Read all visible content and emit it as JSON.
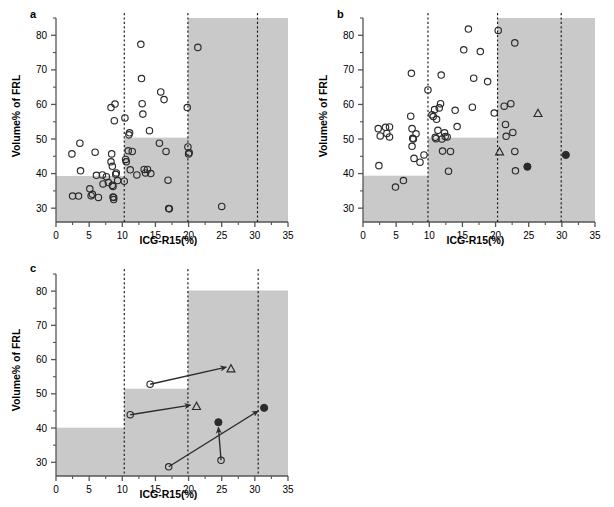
{
  "figure": {
    "axis_label_x": "ICG-R15(%)",
    "axis_label_y": "Volume% of FRL",
    "panel_a_letter": "a",
    "panel_b_letter": "b",
    "panel_c_letter": "c",
    "colors": {
      "shade": "#c9c9c9",
      "axis": "#555555",
      "marker": "#2b2b2b",
      "dashed": "#1a1a1a"
    },
    "xticks": [
      "0",
      "5",
      "10",
      "15",
      "20",
      "25",
      "30",
      "35"
    ],
    "yticks": [
      "30",
      "40",
      "50",
      "60",
      "70",
      "80"
    ]
  },
  "chart_data": [
    {
      "type": "scatter",
      "panel": "a",
      "title": "a",
      "xlabel": "ICG-R15(%)",
      "ylabel": "Volume% of FRL",
      "xlim": [
        0,
        35
      ],
      "ylim": [
        26,
        85
      ],
      "xticks": [
        0,
        5,
        10,
        15,
        20,
        25,
        30,
        35
      ],
      "yticks": [
        30,
        40,
        50,
        60,
        70,
        80
      ],
      "grid": false,
      "legend": "none",
      "vertical_dashed_lines": [
        10.3,
        19.9,
        30.4
      ],
      "shaded_steps": [
        {
          "x0": 0,
          "x1": 10.3,
          "y0": 26,
          "y1": 39.3
        },
        {
          "x0": 10.3,
          "x1": 19.9,
          "y0": 26,
          "y1": 50.4
        },
        {
          "x0": 19.9,
          "x1": 35,
          "y0": 26,
          "y1": 85
        }
      ],
      "series": [
        {
          "name": "open-circle",
          "marker": "open-circle",
          "points": [
            [
              2.4,
              45.7
            ],
            [
              2.5,
              33.5
            ],
            [
              3.4,
              33.5
            ],
            [
              3.6,
              48.8
            ],
            [
              3.7,
              40.8
            ],
            [
              5.1,
              35.6
            ],
            [
              5.3,
              33.6
            ],
            [
              5.5,
              34.0
            ],
            [
              5.9,
              46.2
            ],
            [
              6.1,
              39.5
            ],
            [
              6.4,
              33.1
            ],
            [
              7.0,
              39.6
            ],
            [
              7.1,
              37.0
            ],
            [
              7.6,
              39.1
            ],
            [
              7.9,
              37.4
            ],
            [
              8.3,
              43.4
            ],
            [
              8.3,
              59.1
            ],
            [
              8.4,
              45.7
            ],
            [
              8.5,
              42.1
            ],
            [
              8.5,
              36.6
            ],
            [
              8.6,
              36.3
            ],
            [
              8.6,
              33.2
            ],
            [
              8.7,
              33.1
            ],
            [
              8.7,
              32.5
            ],
            [
              8.8,
              55.3
            ],
            [
              8.9,
              60.1
            ],
            [
              9.0,
              39.8
            ],
            [
              9.1,
              40.2
            ],
            [
              9.3,
              38.0
            ],
            [
              10.3,
              37.8
            ],
            [
              10.4,
              56.1
            ],
            [
              10.5,
              44.1
            ],
            [
              10.6,
              43.4
            ],
            [
              10.9,
              46.6
            ],
            [
              11.0,
              51.2
            ],
            [
              11.1,
              51.8
            ],
            [
              11.2,
              41.1
            ],
            [
              11.5,
              46.4
            ],
            [
              12.2,
              39.6
            ],
            [
              12.8,
              77.4
            ],
            [
              12.9,
              67.5
            ],
            [
              13.0,
              60.2
            ],
            [
              13.1,
              57.2
            ],
            [
              13.3,
              41.2
            ],
            [
              13.5,
              40.2
            ],
            [
              13.8,
              41.2
            ],
            [
              14.1,
              52.4
            ],
            [
              14.3,
              40.0
            ],
            [
              15.6,
              48.8
            ],
            [
              15.8,
              63.6
            ],
            [
              16.3,
              61.4
            ],
            [
              16.6,
              46.4
            ],
            [
              16.9,
              38.1
            ],
            [
              17.0,
              29.9
            ],
            [
              17.1,
              29.8
            ],
            [
              19.8,
              59.1
            ],
            [
              19.9,
              47.7
            ],
            [
              20.0,
              45.7
            ],
            [
              20.1,
              46.0
            ],
            [
              21.4,
              76.5
            ],
            [
              25.0,
              30.5
            ]
          ]
        }
      ]
    },
    {
      "type": "scatter",
      "panel": "b",
      "title": "b",
      "xlabel": "ICG-R15(%)",
      "ylabel": "Volume% of FRL",
      "xlim": [
        0,
        35
      ],
      "ylim": [
        26,
        85
      ],
      "xticks": [
        0,
        5,
        10,
        15,
        20,
        25,
        30,
        35
      ],
      "yticks": [
        30,
        40,
        50,
        60,
        70,
        80
      ],
      "grid": false,
      "legend": "none",
      "vertical_dashed_lines": [
        9.8,
        20.3,
        29.9
      ],
      "shaded_steps": [
        {
          "x0": 0,
          "x1": 9.8,
          "y0": 26,
          "y1": 39.4
        },
        {
          "x0": 9.8,
          "x1": 20.3,
          "y0": 26,
          "y1": 50.4
        },
        {
          "x0": 20.3,
          "x1": 35,
          "y0": 26,
          "y1": 85
        }
      ],
      "series": [
        {
          "name": "open-circle",
          "marker": "open-circle",
          "points": [
            [
              2.3,
              53.0
            ],
            [
              2.4,
              42.3
            ],
            [
              2.6,
              50.9
            ],
            [
              3.4,
              53.4
            ],
            [
              3.6,
              51.6
            ],
            [
              4.0,
              53.5
            ],
            [
              4.0,
              50.6
            ],
            [
              4.9,
              36.1
            ],
            [
              6.1,
              38.0
            ],
            [
              7.2,
              56.6
            ],
            [
              7.3,
              69.0
            ],
            [
              7.4,
              53.0
            ],
            [
              7.4,
              47.9
            ],
            [
              7.5,
              50.2
            ],
            [
              7.6,
              50.0
            ],
            [
              7.7,
              44.4
            ],
            [
              8.0,
              51.5
            ],
            [
              8.6,
              43.3
            ],
            [
              9.2,
              45.4
            ],
            [
              9.8,
              64.2
            ],
            [
              10.4,
              57.0
            ],
            [
              10.6,
              56.5
            ],
            [
              10.8,
              58.5
            ],
            [
              10.9,
              50.5
            ],
            [
              11.0,
              50.1
            ],
            [
              11.1,
              55.7
            ],
            [
              11.3,
              52.5
            ],
            [
              11.5,
              59.0
            ],
            [
              11.7,
              60.2
            ],
            [
              11.8,
              68.5
            ],
            [
              11.9,
              50.0
            ],
            [
              12.0,
              46.5
            ],
            [
              12.3,
              51.8
            ],
            [
              12.4,
              50.7
            ],
            [
              12.7,
              50.6
            ],
            [
              12.9,
              40.7
            ],
            [
              13.2,
              46.4
            ],
            [
              13.9,
              58.3
            ],
            [
              14.2,
              53.6
            ],
            [
              15.2,
              75.8
            ],
            [
              15.9,
              81.8
            ],
            [
              16.5,
              59.2
            ],
            [
              16.7,
              67.6
            ],
            [
              17.7,
              75.3
            ],
            [
              18.8,
              66.6
            ],
            [
              19.8,
              57.5
            ],
            [
              20.4,
              81.4
            ],
            [
              21.3,
              59.5
            ],
            [
              21.5,
              54.2
            ],
            [
              21.6,
              50.8
            ],
            [
              22.3,
              60.2
            ],
            [
              22.6,
              51.9
            ],
            [
              22.9,
              46.4
            ],
            [
              22.9,
              77.8
            ],
            [
              23.0,
              40.8
            ]
          ]
        },
        {
          "name": "open-triangle",
          "marker": "open-triangle",
          "points": [
            [
              20.6,
              46.3
            ],
            [
              26.4,
              57.4
            ]
          ]
        },
        {
          "name": "filled-circle",
          "marker": "filled-circle",
          "points": [
            [
              24.8,
              42.0
            ],
            [
              30.6,
              45.4
            ]
          ]
        }
      ]
    },
    {
      "type": "scatter",
      "panel": "c",
      "title": "c",
      "xlabel": "ICG-R15(%)",
      "ylabel": "Volume% of FRL",
      "xlim": [
        0,
        35
      ],
      "ylim": [
        26,
        85
      ],
      "xticks": [
        0,
        5,
        10,
        15,
        20,
        25,
        30,
        35
      ],
      "yticks": [
        30,
        40,
        50,
        60,
        70,
        80
      ],
      "grid": false,
      "legend": "none",
      "vertical_dashed_lines": [
        10.3,
        19.9,
        30.5
      ],
      "shaded_steps": [
        {
          "x0": 0,
          "x1": 10.3,
          "y0": 26,
          "y1": 40.1
        },
        {
          "x0": 10.3,
          "x1": 19.9,
          "y0": 26,
          "y1": 51.5
        },
        {
          "x0": 19.9,
          "x1": 35,
          "y0": 26,
          "y1": 80.2
        }
      ],
      "series": [
        {
          "name": "open-circle",
          "marker": "open-circle",
          "points": [
            [
              14.2,
              52.8
            ],
            [
              11.2,
              43.9
            ],
            [
              17.0,
              28.7
            ],
            [
              24.9,
              30.6
            ]
          ]
        },
        {
          "name": "open-triangle",
          "marker": "open-triangle",
          "points": [
            [
              26.4,
              57.3
            ],
            [
              21.2,
              46.3
            ]
          ]
        },
        {
          "name": "filled-circle",
          "marker": "filled-circle",
          "points": [
            [
              24.5,
              41.7
            ],
            [
              31.4,
              45.9
            ]
          ]
        }
      ],
      "arrows": [
        {
          "from": [
            14.2,
            52.8
          ],
          "to": [
            25.7,
            57.8
          ]
        },
        {
          "from": [
            11.2,
            43.9
          ],
          "to": [
            20.3,
            46.7
          ]
        },
        {
          "from": [
            17.0,
            28.7
          ],
          "to": [
            30.5,
            45.0
          ]
        },
        {
          "from": [
            24.9,
            30.6
          ],
          "to": [
            24.5,
            40.2
          ]
        }
      ]
    }
  ]
}
